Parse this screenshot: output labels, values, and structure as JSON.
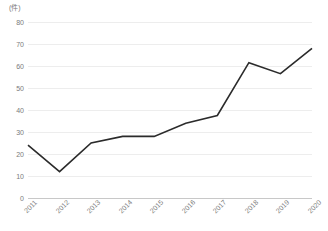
{
  "chart_data": {
    "type": "line",
    "title": "",
    "subtitle": "",
    "xlabel": "",
    "ylabel": "(件)",
    "unit_label": "(件)",
    "categories": [
      "2011",
      "2012",
      "2013",
      "2014",
      "2015",
      "2016",
      "2017",
      "2018",
      "2019",
      "2020"
    ],
    "series": [
      {
        "name": "",
        "values": [
          24,
          12,
          25,
          28,
          28,
          34,
          37.5,
          61.5,
          56.5,
          68
        ]
      }
    ],
    "values": [
      24,
      12,
      25,
      28,
      28,
      34,
      37.5,
      61.5,
      56.5,
      68
    ],
    "ylim": [
      0,
      80
    ],
    "yticks": [
      0,
      10,
      20,
      30,
      40,
      50,
      60,
      70,
      80
    ],
    "ytick_labels": [
      "0",
      "10",
      "20",
      "30",
      "40",
      "50",
      "60",
      "70",
      "80"
    ],
    "grid": true,
    "grid_axis": "y",
    "legend": false,
    "legend_position": "none",
    "line_color": "#2b2b2b",
    "grid_color": "#ededed",
    "axis_color": "#c8c8c8",
    "text_color": "#7b7b7b",
    "background_color": "#ffffff",
    "markers": false,
    "xtick_rotation": -45
  }
}
